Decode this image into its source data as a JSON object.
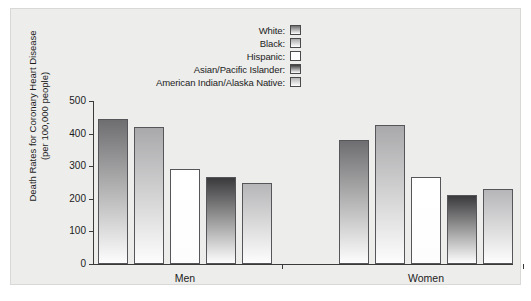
{
  "chart_data": {
    "type": "bar",
    "title": "",
    "xlabel": "",
    "ylabel": "Death Rates for Coronary Heart Disease (per 100,000 people)",
    "ylabel_line1": "Death Rates for Coronary Heart Disease",
    "ylabel_line2": "(per 100,000 people)",
    "categories": [
      "Men",
      "Women"
    ],
    "ylim": [
      0,
      500
    ],
    "yticks": [
      0,
      100,
      200,
      300,
      400,
      500
    ],
    "ytick_labels": [
      "0",
      "100",
      "200",
      "300",
      "400",
      "500"
    ],
    "grid": false,
    "legend_position": "top-center",
    "series": [
      {
        "name": "White:",
        "swatch": "#6e6e70",
        "values": [
          444,
          380
        ]
      },
      {
        "name": "Black:",
        "swatch": "#a9a9ab",
        "values": [
          421,
          427
        ]
      },
      {
        "name": "Hispanic:",
        "swatch": "#ffffff",
        "values": [
          292,
          266
        ]
      },
      {
        "name": "Asian/Pacific Islander:",
        "swatch": "#3a3a3c",
        "values": [
          266,
          213
        ]
      },
      {
        "name": "American Indian/Alaska Native:",
        "swatch": "#b6b6b8",
        "values": [
          248,
          231
        ]
      }
    ]
  },
  "legend": {
    "items": [
      {
        "label": "White:"
      },
      {
        "label": "Black:"
      },
      {
        "label": "Hispanic:"
      },
      {
        "label": "Asian/Pacific Islander:"
      },
      {
        "label": "American Indian/Alaska Native:"
      }
    ]
  },
  "axes": {
    "group_labels": [
      "Men",
      "Women"
    ],
    "y_tick_labels": [
      "500",
      "400",
      "300",
      "200",
      "100",
      "0"
    ],
    "y_title_line1": "Death Rates for Coronary Heart Disease",
    "y_title_line2": "(per 100,000 people)"
  },
  "colors": {
    "panel_background": "#ededeb",
    "axis": "#3a3a3a",
    "text": "#1c1c1c",
    "bar_outline": "#55555a"
  }
}
